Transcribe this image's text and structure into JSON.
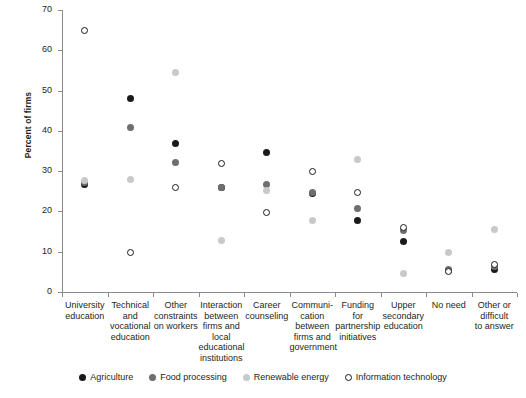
{
  "chart_data": {
    "type": "scatter",
    "title": "",
    "xlabel": "",
    "ylabel": "Percent of firms",
    "ylim": [
      0,
      70
    ],
    "ytick_labels": [
      "0",
      "10",
      "20",
      "30",
      "40",
      "50",
      "60",
      "70"
    ],
    "yticks": [
      0,
      10,
      20,
      30,
      40,
      50,
      60,
      70
    ],
    "grid": false,
    "legend_position": "bottom-center",
    "categories": [
      "University education",
      "Technical and vocational education",
      "Other constraints on workers",
      "Interaction between firms and local educational institutions",
      "Career counseling",
      "Communication between firms and government",
      "Funding for partnership initiatives",
      "Upper secondary education",
      "No need",
      "Other or difficult to answer"
    ],
    "category_label_lines": [
      [
        "University",
        "education"
      ],
      [
        "Technical",
        "and",
        "vocational",
        "education"
      ],
      [
        "Other",
        "constraints",
        "on workers"
      ],
      [
        "Interaction",
        "between",
        "firms and",
        "local",
        "educational",
        "institutions"
      ],
      [
        "Career",
        "counseling"
      ],
      [
        "Communi-",
        "cation",
        "between",
        "firms and",
        "government"
      ],
      [
        "Funding for",
        "partnership",
        "initiatives"
      ],
      [
        "Upper",
        "secondary",
        "education"
      ],
      [
        "No need"
      ],
      [
        "Other or",
        "difficult",
        "to answer"
      ]
    ],
    "series": [
      {
        "name": "Agriculture",
        "key": "agriculture",
        "color": "#1a1a1a",
        "marker": "filled-circle",
        "values": [
          26.6,
          48.0,
          36.9,
          26.0,
          34.7,
          24.5,
          17.8,
          12.5,
          5.4,
          5.6
        ]
      },
      {
        "name": "Food processing",
        "key": "food-processing",
        "color": "#6e6e6e",
        "marker": "filled-circle",
        "values": [
          27.2,
          40.9,
          32.1,
          26.0,
          26.6,
          24.6,
          20.8,
          15.3,
          5.7,
          6.3
        ]
      },
      {
        "name": "Renewable energy",
        "key": "renewable-energy",
        "color": "#c9c9c9",
        "marker": "filled-circle",
        "values": [
          27.8,
          27.9,
          54.5,
          12.9,
          25.2,
          17.7,
          32.8,
          4.6,
          9.7,
          15.4
        ]
      },
      {
        "name": "Information technology",
        "key": "information-technology",
        "color": "#ffffff",
        "marker": "open-circle",
        "values": [
          65.0,
          9.8,
          25.9,
          32.0,
          19.7,
          29.8,
          24.7,
          16.1,
          5.1,
          6.9
        ]
      }
    ]
  },
  "legend": {
    "items": [
      {
        "label": "Agriculture"
      },
      {
        "label": "Food processing"
      },
      {
        "label": "Renewable energy"
      },
      {
        "label": "Information technology"
      }
    ]
  }
}
